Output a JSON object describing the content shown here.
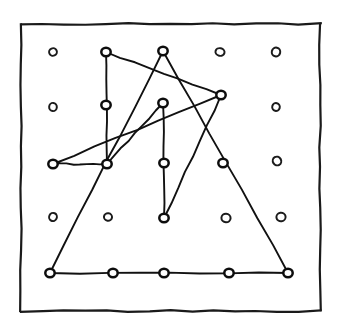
{
  "figure": {
    "kind": "geoboard-polygon-diagram",
    "caption": "",
    "width": 340,
    "height": 327,
    "background_color": "#ffffff",
    "ink_color": "#111111",
    "frame": {
      "name": "hand-drawn-border",
      "x": 21,
      "y": 24,
      "width": 299,
      "height": 287,
      "stroke_width": 2.2,
      "stroke_color": "#1a1a1a"
    },
    "grid": {
      "columns": 5,
      "rows": 5,
      "origin_x": 53,
      "origin_y": 52,
      "step_x": 55.7,
      "step_y": 55.2,
      "marker_shape": "small-ellipse-ring",
      "marker_radius_x": 4.2,
      "marker_radius_y": 4.0,
      "stroke_width": 2.0,
      "stroke_color": "#1b1b1b"
    },
    "points": [
      {
        "id": "p00",
        "col": 0,
        "row": 0,
        "x": 53,
        "y": 52,
        "marked": false
      },
      {
        "id": "p10",
        "col": 1,
        "row": 0,
        "x": 106,
        "y": 52,
        "marked": true
      },
      {
        "id": "p20",
        "col": 2,
        "row": 0,
        "x": 163,
        "y": 51,
        "marked": true
      },
      {
        "id": "p30",
        "col": 3,
        "row": 0,
        "x": 220,
        "y": 52,
        "marked": false
      },
      {
        "id": "p40",
        "col": 4,
        "row": 0,
        "x": 276,
        "y": 52,
        "marked": false
      },
      {
        "id": "p01",
        "col": 0,
        "row": 1,
        "x": 53,
        "y": 107,
        "marked": false
      },
      {
        "id": "p11",
        "col": 1,
        "row": 1,
        "x": 106,
        "y": 105,
        "marked": true
      },
      {
        "id": "p21",
        "col": 2,
        "row": 1,
        "x": 163,
        "y": 103,
        "marked": true
      },
      {
        "id": "p31",
        "col": 3,
        "row": 1,
        "x": 221,
        "y": 95,
        "marked": true
      },
      {
        "id": "p41",
        "col": 4,
        "row": 1,
        "x": 276,
        "y": 107,
        "marked": false
      },
      {
        "id": "p02",
        "col": 0,
        "row": 2,
        "x": 53,
        "y": 164,
        "marked": true
      },
      {
        "id": "p12",
        "col": 1,
        "row": 2,
        "x": 107,
        "y": 164,
        "marked": true
      },
      {
        "id": "p22",
        "col": 2,
        "row": 2,
        "x": 164,
        "y": 163,
        "marked": true
      },
      {
        "id": "p32",
        "col": 3,
        "row": 2,
        "x": 223,
        "y": 163,
        "marked": true
      },
      {
        "id": "p42",
        "col": 4,
        "row": 2,
        "x": 277,
        "y": 161,
        "marked": false
      },
      {
        "id": "p03",
        "col": 0,
        "row": 3,
        "x": 53,
        "y": 217,
        "marked": false
      },
      {
        "id": "p13",
        "col": 1,
        "row": 3,
        "x": 108,
        "y": 217,
        "marked": false
      },
      {
        "id": "p23",
        "col": 2,
        "row": 3,
        "x": 164,
        "y": 218,
        "marked": true
      },
      {
        "id": "p33",
        "col": 3,
        "row": 3,
        "x": 226,
        "y": 218,
        "marked": false
      },
      {
        "id": "p43",
        "col": 4,
        "row": 3,
        "x": 281,
        "y": 217,
        "marked": false
      },
      {
        "id": "p04",
        "col": 0,
        "row": 4,
        "x": 50,
        "y": 273,
        "marked": true
      },
      {
        "id": "p14",
        "col": 1,
        "row": 4,
        "x": 113,
        "y": 273,
        "marked": true
      },
      {
        "id": "p24",
        "col": 2,
        "row": 4,
        "x": 164,
        "y": 273,
        "marked": true
      },
      {
        "id": "p34",
        "col": 3,
        "row": 4,
        "x": 229,
        "y": 273,
        "marked": true
      },
      {
        "id": "p44",
        "col": 4,
        "row": 4,
        "x": 288,
        "y": 273,
        "marked": true
      }
    ],
    "paths": [
      {
        "id": "large-triangle",
        "name": "large-triangle-path",
        "closed": true,
        "stroke_width": 1.9,
        "vertex_ids": [
          "p20",
          "p44",
          "p04"
        ]
      },
      {
        "id": "left-quad",
        "name": "left-polyline-path",
        "closed": false,
        "stroke_width": 1.9,
        "vertex_ids": [
          "p10",
          "p12",
          "p02",
          "p31",
          "p10"
        ]
      },
      {
        "id": "inner-zigzag",
        "name": "inner-zigzag-path",
        "closed": false,
        "stroke_width": 1.9,
        "vertex_ids": [
          "p23",
          "p21",
          "p12"
        ]
      },
      {
        "id": "right-diagonal",
        "name": "right-diagonal-path",
        "closed": false,
        "stroke_width": 1.9,
        "vertex_ids": [
          "p23",
          "p31"
        ]
      }
    ]
  }
}
